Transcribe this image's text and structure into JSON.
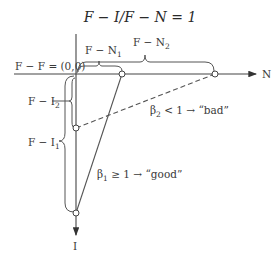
{
  "title": "F − I/F − N = 1",
  "axes": {
    "x_label": "N",
    "y_label": "I",
    "origin_label": "F − F = (0,0)"
  },
  "braces": {
    "n1": "F − N",
    "n1_sub": "1",
    "n2": "F − N",
    "n2_sub": "2",
    "i2": "F − I",
    "i2_sub": "2",
    "i1": "F − I",
    "i1_sub": "1"
  },
  "lines": {
    "beta1": {
      "symbol": "β",
      "sub": "1",
      "text": " ≥ 1 → “good”",
      "style": "solid"
    },
    "beta2": {
      "symbol": "β",
      "sub": "2",
      "text": " < 1 → “bad”",
      "style": "dashed"
    }
  },
  "colors": {
    "ink": "#444444",
    "background": "#ffffff"
  }
}
